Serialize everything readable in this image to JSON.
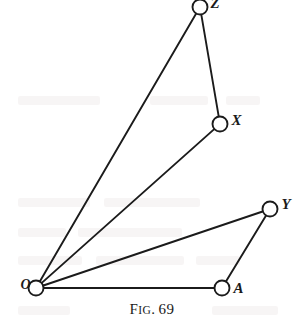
{
  "figure": {
    "caption_prefix": "F",
    "caption_smallcaps": "IG",
    "caption_period": ".",
    "caption_number": "69",
    "caption_full": "FIG. 69",
    "stroke_color": "#1b1b1b",
    "node_fill": "#ffffff",
    "background": "#ffffff",
    "width": 304,
    "height": 326
  },
  "chart_data": {
    "type": "diagram",
    "subtitle": "",
    "xlabel": "",
    "ylabel": "",
    "xlim": [
      0,
      304
    ],
    "ylim": [
      0,
      326
    ],
    "grid": false,
    "legend": "none",
    "nodes": [
      {
        "id": "O",
        "label": "O",
        "x": 36,
        "y": 288,
        "r": 7.5,
        "label_dx": -17,
        "label_dy": -8,
        "label_class": "label-o"
      },
      {
        "id": "Z",
        "label": "Z",
        "x": 200,
        "y": 7,
        "r": 7.5,
        "label_dx": 9,
        "label_dy": -9,
        "label_class": "label-big"
      },
      {
        "id": "X",
        "label": "X",
        "x": 220,
        "y": 124,
        "r": 7.5,
        "label_dx": 10,
        "label_dy": -9,
        "label_class": "label-big"
      },
      {
        "id": "Y",
        "label": "Y",
        "x": 270,
        "y": 209,
        "r": 7.5,
        "label_dx": 10,
        "label_dy": -10,
        "label_class": "label-big"
      },
      {
        "id": "A",
        "label": "A",
        "x": 222,
        "y": 288,
        "r": 7.5,
        "label_dx": 10,
        "label_dy": -5,
        "label_class": "label-big"
      }
    ],
    "edges": [
      {
        "id": "O-Z",
        "from": "O",
        "to": "Z",
        "name": "edge-o-z"
      },
      {
        "id": "O-X",
        "from": "O",
        "to": "X",
        "name": "edge-o-x"
      },
      {
        "id": "O-Y",
        "from": "O",
        "to": "Y",
        "name": "edge-o-y"
      },
      {
        "id": "O-A",
        "from": "O",
        "to": "A",
        "name": "edge-o-a"
      },
      {
        "id": "Z-X",
        "from": "Z",
        "to": "X",
        "name": "edge-z-x"
      },
      {
        "id": "Y-A",
        "from": "Y",
        "to": "A",
        "name": "edge-y-a"
      }
    ],
    "stroke_width": 1.9
  }
}
